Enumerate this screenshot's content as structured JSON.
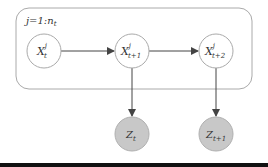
{
  "diagram": {
    "type": "graphical-model",
    "plate": {
      "label": "j=1:n",
      "label_sub": "t"
    },
    "nodes": [
      {
        "id": "x_t",
        "base": "X",
        "sup": "j",
        "sub": "t",
        "observed": false
      },
      {
        "id": "x_t1",
        "base": "X",
        "sup": "j",
        "sub": "t+1",
        "observed": false
      },
      {
        "id": "x_t2",
        "base": "X",
        "sup": "j",
        "sub": "t+2",
        "observed": false
      },
      {
        "id": "z_t",
        "base": "Z",
        "sub": "t",
        "observed": true
      },
      {
        "id": "z_t1",
        "base": "Z",
        "sub": "t+1",
        "observed": true
      }
    ],
    "edges": [
      {
        "from": "x_t",
        "to": "x_t1"
      },
      {
        "from": "x_t1",
        "to": "x_t2"
      },
      {
        "from": "x_t1",
        "to": "z_t"
      },
      {
        "from": "x_t2",
        "to": "z_t1"
      }
    ],
    "colors": {
      "latent_fill": "#ffffff",
      "observed_fill": "#c8c8c8",
      "stroke": "#999999",
      "arrow": "#444444",
      "plate_stroke": "#aaaaaa",
      "bottom_bar": "#111111"
    }
  }
}
